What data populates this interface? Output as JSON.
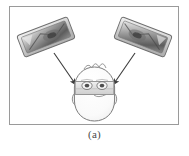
{
  "figure": {
    "caption": "(a)",
    "panel_label": "(a)",
    "alt_summary": "Two tilted camera devices in the upper corners with arrows pointing toward a person's head wearing an eye-tracking visor",
    "frame_color": "#9a9a9a",
    "background_color": "#ffffff"
  },
  "devices": [
    {
      "id": "left-camera",
      "label": "",
      "position": "upper-left",
      "rotation_deg": -22,
      "body_color": "#d8d8d8",
      "edge_color": "#6d6d6d",
      "lens_color": "#5a5a5a"
    },
    {
      "id": "right-camera",
      "label": "",
      "position": "upper-right",
      "rotation_deg": 22,
      "body_color": "#d8d8d8",
      "edge_color": "#6d6d6d",
      "lens_color": "#5a5a5a"
    }
  ],
  "arrows": [
    {
      "id": "left-arrow",
      "from": "left-camera",
      "to": "head-left-side",
      "color": "#3c3c3c"
    },
    {
      "id": "right-arrow",
      "from": "right-camera",
      "to": "head-right-side",
      "color": "#3c3c3c"
    }
  ],
  "subject": {
    "id": "head",
    "label": "",
    "outline_color": "#7a7a7a",
    "fill_color": "#fbfbfb",
    "visor_color": "#e0e0e0",
    "eyes": [
      {
        "id": "left-eye",
        "shape": "oval"
      },
      {
        "id": "right-eye",
        "shape": "oval"
      }
    ],
    "ears": [
      {
        "id": "left-ear"
      },
      {
        "id": "right-ear"
      }
    ]
  }
}
